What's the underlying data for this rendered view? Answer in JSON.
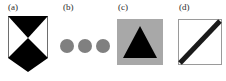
{
  "figure": {
    "width": 226,
    "height": 81,
    "background": "#ffffff",
    "panels": [
      {
        "key": "a",
        "label": "(a)",
        "shape_name": "triangle-over-diamond",
        "description": "white square outline containing a black downward-pointing triangle on top and a black diamond below, meeting at a center point",
        "fill_color": "#000000",
        "frame_color": "#6e6e6e",
        "background_color": "#ffffff"
      },
      {
        "key": "b",
        "label": "(b)",
        "shape_name": "three-gray-circles",
        "description": "a horizontal row of three equal medium-gray filled circles",
        "fill_color": "#808080",
        "count": 3,
        "background_color": "#ffffff"
      },
      {
        "key": "c",
        "label": "(c)",
        "shape_name": "triangle-on-gray-square",
        "description": "a medium-gray filled square containing a black upward-pointing triangle",
        "fill_color": "#000000",
        "square_color": "#a8a8a8",
        "background_color": "#ffffff"
      },
      {
        "key": "d",
        "label": "(d)",
        "shape_name": "diagonal-line-in-square",
        "description": "a white square with thin gray outline crossed by a thick black diagonal stroke from bottom-left to top-right",
        "stroke_color": "#1a1a1a",
        "frame_color": "#9a9a9a",
        "background_color": "#ffffff"
      }
    ]
  }
}
